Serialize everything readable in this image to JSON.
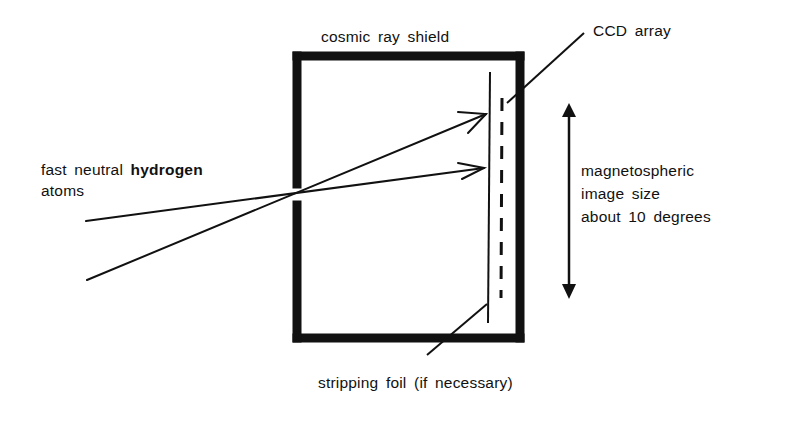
{
  "diagram": {
    "labels": {
      "shield": "cosmic ray shield",
      "ccd": "CCD array",
      "atoms_line1_a": "fast neutral",
      "atoms_line1_b": "hydrogen",
      "atoms_line2": "atoms",
      "image_size_line1": "magnetospheric",
      "image_size_line2": "image size",
      "image_size_line3": "about 10 degrees",
      "foil": "stripping foil (if necessary)"
    },
    "colors": {
      "ink": "#111111",
      "background": "#ffffff"
    },
    "components": [
      "cosmic-ray-shield-box",
      "entrance-aperture",
      "stripping-foil",
      "ccd-array",
      "neutral-atom-rays",
      "image-size-double-arrow"
    ]
  }
}
